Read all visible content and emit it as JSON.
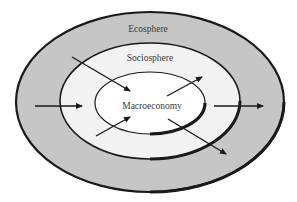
{
  "diagram": {
    "type": "nested-ellipses",
    "colors": {
      "background": "#ffffff",
      "ecosphere_fill": "#c6c6c6",
      "sociosphere_fill": "#f2f2f2",
      "macroeconomy_fill": "#ffffff",
      "stroke": "#1a1a1a",
      "text": "#3a3a3a"
    },
    "layers": [
      {
        "id": "ecosphere",
        "label": "Ecosphere"
      },
      {
        "id": "sociosphere",
        "label": "Sociosphere"
      },
      {
        "id": "macroeconomy",
        "label": "Macroeconomy"
      }
    ],
    "arrows": [
      {
        "id": "ecosphere-inflow",
        "direction": "left-to-right, ecosphere into sociosphere"
      },
      {
        "id": "sociosphere-to-macro-upper-left",
        "direction": "diagonal down-right into macroeconomy"
      },
      {
        "id": "sociosphere-to-macro-lower-left",
        "direction": "diagonal up-right into macroeconomy"
      },
      {
        "id": "macro-to-sociosphere-upper-right",
        "direction": "diagonal up-right out of macroeconomy"
      },
      {
        "id": "macro-to-ecosphere-lower-right",
        "direction": "diagonal down-right out of macroeconomy"
      },
      {
        "id": "sociosphere-outflow",
        "direction": "left-to-right, sociosphere into ecosphere"
      }
    ]
  }
}
